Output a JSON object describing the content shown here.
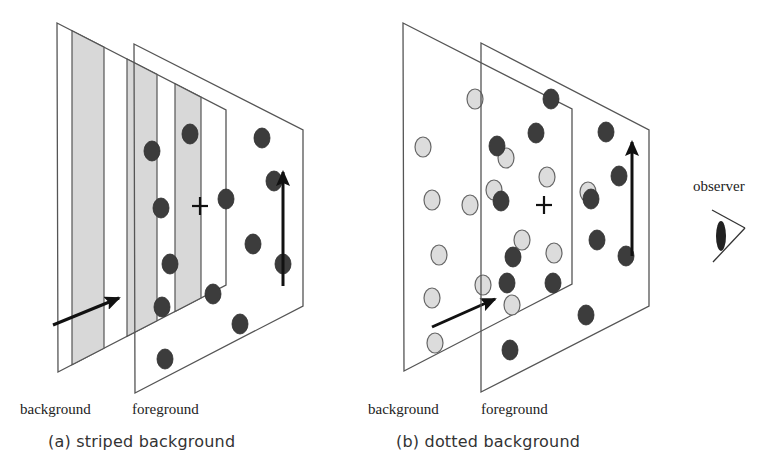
{
  "figure": {
    "colors": {
      "plane_stroke": "#555555",
      "stripe_fill": "#d8d8d8",
      "dark_dot": "#3c3c3c",
      "light_dot": "#dcdcdc",
      "light_dot_stroke": "#666666",
      "arrow": "#111111"
    },
    "panel_a": {
      "caption": "(a)  striped background",
      "bg_label": "background",
      "fg_label": "foreground",
      "bg_plane": [
        [
          57,
          23
        ],
        [
          226,
          110
        ],
        [
          226,
          285
        ],
        [
          58,
          372
        ]
      ],
      "fg_plane": [
        [
          134,
          44
        ],
        [
          303,
          130
        ],
        [
          303,
          306
        ],
        [
          135,
          393
        ]
      ],
      "stripes": [
        [
          72,
          104
        ],
        [
          127,
          157
        ],
        [
          175,
          201
        ]
      ],
      "dark_dots": [
        [
          152,
          151
        ],
        [
          190,
          134
        ],
        [
          161,
          208
        ],
        [
          226,
          199
        ],
        [
          262,
          138
        ],
        [
          274,
          181
        ],
        [
          253,
          244
        ],
        [
          170,
          264
        ],
        [
          162,
          307
        ],
        [
          213,
          294
        ],
        [
          240,
          324
        ],
        [
          165,
          359
        ],
        [
          283,
          264
        ]
      ],
      "fixation_cross": [
        200,
        206
      ],
      "bg_arrow": {
        "from": [
          53,
          325
        ],
        "to": [
          119,
          298
        ]
      },
      "fg_arrow": {
        "from": [
          283,
          286
        ],
        "to": [
          283,
          172
        ]
      }
    },
    "panel_b": {
      "caption": "(b)  dotted background",
      "bg_label": "background",
      "fg_label": "foreground",
      "bg_plane": [
        [
          403,
          23
        ],
        [
          572,
          109
        ],
        [
          572,
          284
        ],
        [
          404,
          371
        ]
      ],
      "fg_plane": [
        [
          481,
          43
        ],
        [
          649,
          130
        ],
        [
          649,
          306
        ],
        [
          481,
          392
        ]
      ],
      "light_dots": [
        [
          475,
          99
        ],
        [
          423,
          147
        ],
        [
          506,
          158
        ],
        [
          547,
          177
        ],
        [
          432,
          200
        ],
        [
          470,
          205
        ],
        [
          494,
          190
        ],
        [
          522,
          240
        ],
        [
          554,
          253
        ],
        [
          439,
          255
        ],
        [
          432,
          298
        ],
        [
          483,
          285
        ],
        [
          512,
          305
        ],
        [
          435,
          343
        ],
        [
          588,
          192
        ]
      ],
      "dark_dots": [
        [
          551,
          99
        ],
        [
          536,
          133
        ],
        [
          497,
          146
        ],
        [
          501,
          201
        ],
        [
          513,
          257
        ],
        [
          507,
          283
        ],
        [
          553,
          283
        ],
        [
          510,
          350
        ],
        [
          606,
          132
        ],
        [
          619,
          176
        ],
        [
          591,
          199
        ],
        [
          597,
          240
        ],
        [
          626,
          256
        ],
        [
          586,
          315
        ]
      ],
      "fixation_cross": [
        544,
        205
      ],
      "bg_arrow": {
        "from": [
          432,
          327
        ],
        "to": [
          495,
          299
        ]
      },
      "fg_arrow": {
        "from": [
          632,
          256
        ],
        "to": [
          632,
          142
        ]
      }
    },
    "observer": {
      "label": "observer"
    }
  }
}
